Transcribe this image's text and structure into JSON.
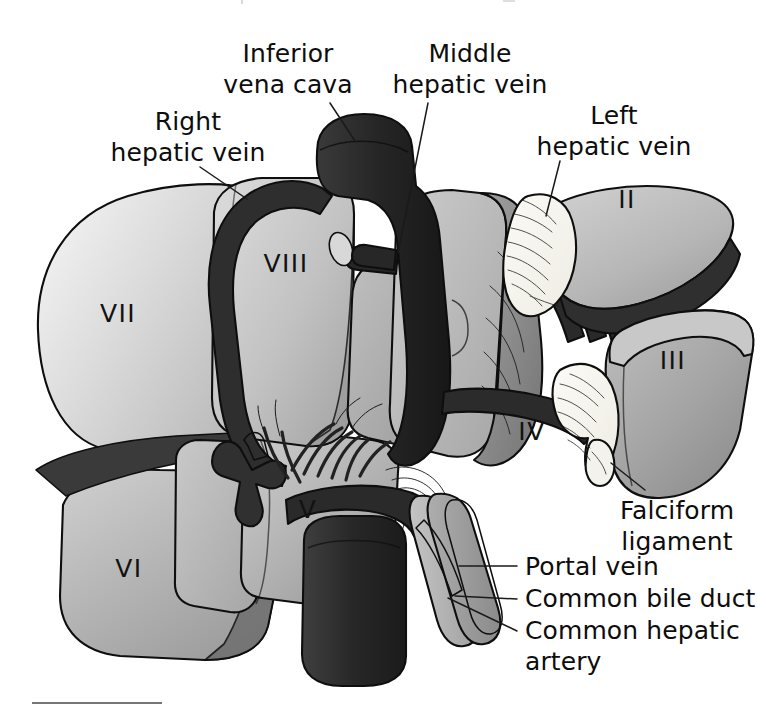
{
  "figure": {
    "kind": "anatomical-illustration",
    "background_color": "#ffffff",
    "width": 766,
    "height": 717
  },
  "annotations": [
    {
      "id": "inferior-vena-cava",
      "lines": [
        "Inferior",
        "vena cava"
      ],
      "text_anchor": "middle",
      "x": 288,
      "y": 62,
      "line_height": 31,
      "leader": "M 330 103 L 355 141"
    },
    {
      "id": "right-hepatic-vein",
      "lines": [
        "Right",
        "hepatic vein"
      ],
      "text_anchor": "middle",
      "x": 188,
      "y": 130,
      "line_height": 31,
      "leader": "M 200 167 L 247 199"
    },
    {
      "id": "middle-hepatic-vein",
      "lines": [
        "Middle",
        "hepatic vein"
      ],
      "text_anchor": "middle",
      "x": 470,
      "y": 62,
      "line_height": 31,
      "leader": "M 428 103 L 398 253"
    },
    {
      "id": "left-hepatic-vein",
      "lines": [
        "Left",
        "hepatic vein"
      ],
      "text_anchor": "middle",
      "x": 614,
      "y": 124,
      "line_height": 31,
      "leader": "M 560 161 L 546 216"
    },
    {
      "id": "falciform-ligament",
      "lines": [
        "Falciform",
        "ligament"
      ],
      "text_anchor": "middle",
      "x": 677,
      "y": 519,
      "line_height": 31,
      "leader": "M 645 490 L 611 463"
    },
    {
      "id": "portal-vein",
      "lines": [
        "Portal vein"
      ],
      "text_anchor": "start",
      "x": 525,
      "y": 575,
      "line_height": 31,
      "leader": "M 517 566 L 459 566"
    },
    {
      "id": "common-bile-duct",
      "lines": [
        "Common bile duct"
      ],
      "text_anchor": "start",
      "x": 525,
      "y": 607,
      "line_height": 31,
      "leader": "M 517 599 L 455 596"
    },
    {
      "id": "common-hepatic-artery",
      "lines": [
        "Common hepatic",
        "artery"
      ],
      "text_anchor": "start",
      "x": 525,
      "y": 639,
      "line_height": 31,
      "leader": "M 517 631 L 448 598"
    }
  ],
  "segment_labels": [
    {
      "id": "segment-vii",
      "text": "VII",
      "x": 118,
      "y": 322
    },
    {
      "id": "segment-viii",
      "text": "VIII",
      "x": 286,
      "y": 272
    },
    {
      "id": "segment-ii",
      "text": "II",
      "x": 627,
      "y": 208
    },
    {
      "id": "segment-iii",
      "text": "III",
      "x": 673,
      "y": 369
    },
    {
      "id": "segment-iv",
      "text": "IV",
      "x": 532,
      "y": 440
    },
    {
      "id": "segment-v",
      "text": "V",
      "x": 308,
      "y": 518
    },
    {
      "id": "segment-vi",
      "text": "VI",
      "x": 129,
      "y": 577
    }
  ],
  "palette": {
    "paper": "#ffffff",
    "vessel_dark": "#2b2b2b",
    "vessel_mid": "#4a4a4a",
    "liver_lightest": "#e2e2e2",
    "liver_light": "#d2d2d2",
    "liver_mid": "#bcbcbc",
    "liver_medium": "#a8a8a8",
    "liver_dark": "#8d8d8d",
    "liver_darker": "#767676",
    "ligament_pale": "#f3f1ea",
    "outline": "#0e0e0e"
  },
  "footer": {
    "rule_visible": true
  }
}
